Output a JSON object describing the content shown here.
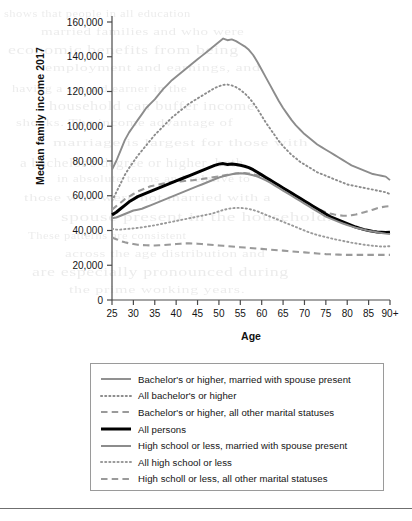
{
  "chart_data": {
    "type": "line",
    "title": "",
    "xlabel": "Age",
    "ylabel": "Median family income 2017",
    "xlim": [
      25,
      90
    ],
    "ylim": [
      0,
      160000
    ],
    "xticks": [
      "25",
      "30",
      "35",
      "40",
      "45",
      "50",
      "55",
      "60",
      "65",
      "70",
      "75",
      "80",
      "85",
      "90+"
    ],
    "xtick_values": [
      25,
      30,
      35,
      40,
      45,
      50,
      55,
      60,
      65,
      70,
      75,
      80,
      85,
      90
    ],
    "yticks": [
      "0",
      "20,000",
      "40,000",
      "60,000",
      "80,000",
      "100,000",
      "120,000",
      "140,000",
      "160,000"
    ],
    "ytick_values": [
      0,
      20000,
      40000,
      60000,
      80000,
      100000,
      120000,
      140000,
      160000
    ],
    "grid": false,
    "legend_position": "below-plot",
    "x": [
      25,
      26,
      27,
      28,
      29,
      30,
      31,
      32,
      33,
      34,
      35,
      36,
      37,
      38,
      39,
      40,
      41,
      42,
      43,
      44,
      45,
      46,
      47,
      48,
      49,
      50,
      51,
      52,
      53,
      54,
      55,
      56,
      57,
      58,
      59,
      60,
      61,
      62,
      63,
      64,
      65,
      66,
      67,
      68,
      69,
      70,
      71,
      72,
      73,
      74,
      75,
      76,
      77,
      78,
      79,
      80,
      81,
      82,
      83,
      84,
      85,
      86,
      87,
      88,
      89,
      90
    ],
    "series": [
      {
        "name": "Bachelor's or higher, married with spouse present",
        "color": "#8c8c8c",
        "style": "solid",
        "width": 1.9,
        "values": [
          75000,
          80000,
          86000,
          92000,
          96500,
          100000,
          103500,
          107000,
          110500,
          113000,
          115500,
          118500,
          121500,
          124000,
          126500,
          128500,
          130500,
          132500,
          134500,
          136500,
          138500,
          140500,
          142500,
          144500,
          146500,
          148500,
          150500,
          149500,
          150000,
          149000,
          147500,
          146000,
          144000,
          141000,
          137000,
          132500,
          128000,
          123500,
          119000,
          114500,
          110500,
          107000,
          103500,
          100500,
          98000,
          95500,
          93500,
          91500,
          89500,
          88000,
          86500,
          85000,
          83500,
          82000,
          80500,
          79000,
          77500,
          76500,
          75500,
          74500,
          73500,
          72500,
          72000,
          71500,
          71000,
          69000
        ]
      },
      {
        "name": "All bachelor's or higher",
        "color": "#8c8c8c",
        "style": "dotted",
        "width": 1.9,
        "values": [
          57000,
          62000,
          67000,
          72000,
          76000,
          79500,
          83000,
          86000,
          89000,
          92000,
          95000,
          97500,
          100000,
          102500,
          105000,
          107000,
          109000,
          111000,
          113000,
          114500,
          116000,
          117500,
          119000,
          120500,
          122000,
          123000,
          123800,
          124000,
          123500,
          122500,
          121000,
          119000,
          116500,
          113500,
          110000,
          106000,
          102000,
          98500,
          95000,
          91500,
          88500,
          86000,
          83500,
          81500,
          79500,
          78000,
          76500,
          75000,
          73500,
          72500,
          71500,
          70500,
          69500,
          68500,
          67500,
          66500,
          66000,
          65500,
          65000,
          64500,
          64000,
          63500,
          63000,
          62500,
          62000,
          61000
        ]
      },
      {
        "name": "Bachelor's or higher, all other marital statuses",
        "color": "#9a9a9a",
        "style": "dashed",
        "width": 2.1,
        "values": [
          52000,
          54000,
          56000,
          58000,
          59500,
          61000,
          62500,
          63500,
          64500,
          65500,
          66000,
          66500,
          67000,
          67500,
          67800,
          68000,
          68200,
          68500,
          68800,
          69000,
          69300,
          69600,
          70000,
          70400,
          70800,
          71200,
          71600,
          72000,
          72400,
          72800,
          73000,
          73000,
          72800,
          72400,
          71800,
          71000,
          70000,
          68800,
          67500,
          66000,
          64500,
          63000,
          61500,
          60000,
          58500,
          57000,
          55500,
          54000,
          52500,
          51500,
          50500,
          49800,
          49200,
          48800,
          48500,
          48500,
          48800,
          49200,
          49800,
          50500,
          51200,
          52000,
          52800,
          53400,
          53800,
          54000
        ]
      },
      {
        "name": "All persons",
        "color": "#000000",
        "style": "solid",
        "width": 3.0,
        "values": [
          49000,
          50500,
          52500,
          54500,
          56500,
          58000,
          59500,
          60500,
          61500,
          62500,
          63500,
          64500,
          65500,
          66500,
          67500,
          68500,
          69500,
          70500,
          71500,
          72500,
          73500,
          74500,
          75500,
          76500,
          77500,
          78200,
          78500,
          78000,
          78300,
          78000,
          77500,
          77000,
          76200,
          75000,
          73500,
          72000,
          70500,
          69000,
          67500,
          66000,
          64500,
          63000,
          61500,
          60000,
          58500,
          57000,
          55500,
          54000,
          52500,
          51000,
          49500,
          48000,
          47000,
          46000,
          45000,
          44000,
          43000,
          42000,
          41200,
          40500,
          40000,
          39500,
          39200,
          39000,
          38800,
          39000
        ]
      },
      {
        "name": "High school or less, married with spouse present",
        "color": "#8c8c8c",
        "style": "solid",
        "width": 2.0,
        "values": [
          47000,
          47500,
          48500,
          49500,
          50500,
          51500,
          52000,
          52500,
          53500,
          54500,
          55500,
          56500,
          57500,
          58500,
          59500,
          60500,
          61500,
          62500,
          63500,
          64500,
          65500,
          66500,
          67500,
          68500,
          69500,
          70500,
          71200,
          71800,
          72400,
          72800,
          73000,
          72800,
          72400,
          71800,
          71000,
          70000,
          68800,
          67500,
          66000,
          64500,
          63000,
          61500,
          60000,
          58500,
          57000,
          55500,
          54000,
          52500,
          51000,
          49500,
          48000,
          47000,
          46000,
          45000,
          44000,
          43200,
          42400,
          41600,
          41000,
          40400,
          39800,
          39400,
          39000,
          38600,
          38200,
          38000
        ]
      },
      {
        "name": "All high school or less",
        "color": "#9a9a9a",
        "style": "dotted",
        "width": 1.9,
        "values": [
          41000,
          40500,
          40500,
          40800,
          41000,
          41200,
          41500,
          41800,
          42200,
          42600,
          43000,
          43500,
          44000,
          44500,
          45000,
          45500,
          46000,
          46500,
          47000,
          47500,
          48000,
          48500,
          49000,
          49500,
          50200,
          51000,
          51800,
          52400,
          52800,
          53000,
          53000,
          52800,
          52400,
          51800,
          51000,
          50000,
          49000,
          48000,
          47000,
          46000,
          45000,
          44000,
          43000,
          42000,
          41000,
          40000,
          39000,
          38200,
          37400,
          36800,
          36200,
          35600,
          35000,
          34500,
          34000,
          33500,
          33000,
          32600,
          32200,
          31800,
          31500,
          31200,
          31000,
          30800,
          30800,
          31000
        ]
      },
      {
        "name": "High scholl or less, all other marital statuses",
        "color": "#9a9a9a",
        "style": "dashed",
        "width": 2.1,
        "values": [
          36000,
          35000,
          34000,
          33200,
          32600,
          32200,
          31800,
          31600,
          31500,
          31400,
          31400,
          31500,
          31600,
          31800,
          32000,
          32200,
          32400,
          32600,
          32600,
          32500,
          32400,
          32200,
          32000,
          31800,
          31600,
          31400,
          31200,
          31000,
          30800,
          30600,
          30400,
          30200,
          30000,
          29800,
          29600,
          29400,
          29200,
          29000,
          28800,
          28600,
          28400,
          28200,
          28000,
          27800,
          27600,
          27400,
          27200,
          27000,
          26800,
          26600,
          26400,
          26300,
          26200,
          26100,
          26000,
          26000,
          26000,
          26000,
          26000,
          26000,
          26000,
          26000,
          26000,
          26000,
          26000,
          26000
        ]
      }
    ]
  },
  "axis": {
    "xlabel": "Age",
    "ylabel": "Median family income 2017"
  },
  "legend": {
    "items": [
      {
        "label": "Bachelor's or higher, married with spouse present"
      },
      {
        "label": "All bachelor's or higher"
      },
      {
        "label": "Bachelor's or higher, all other marital statuses"
      },
      {
        "label": "All persons"
      },
      {
        "label": "High school or less, married with spouse present"
      },
      {
        "label": "All high school or less"
      },
      {
        "label": "High scholl or less, all other marital statuses"
      }
    ]
  },
  "background_text": {
    "lines": [
      "shows that people in all education",
      "married families and who were",
      "economic benefits from being",
      "employment and earnings, and",
      "having a second earner in the",
      "household can buffer income",
      "shocks. The income advantage of",
      "marriage is largest for those with",
      "a bachelor's degree or higher, both",
      "in absolute terms and relative to",
      "those who were not married with a",
      "spouse present in the household.",
      "These patterns are consistent",
      "across the age distribution and",
      "are especially pronounced during",
      "the prime working years."
    ]
  }
}
